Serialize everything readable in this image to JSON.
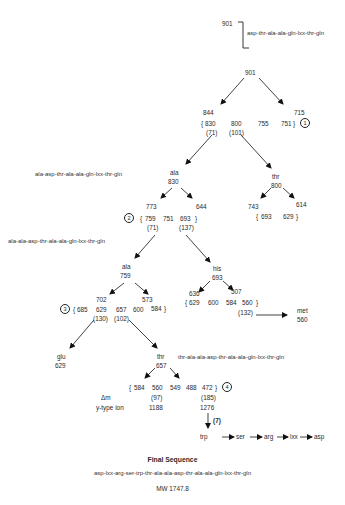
{
  "parent": {
    "mass": "901",
    "sequence": "asp-thr-ala-ala-gln-lxx-thr-gln"
  },
  "tree": {
    "root": "901",
    "level1": {
      "left": "844",
      "right": "715",
      "group": [
        "830",
        "800",
        "755",
        "751"
      ],
      "deltas": [
        "(71)",
        "(101)"
      ],
      "marker": "1"
    },
    "branch_ala830": {
      "sequence": "ala-asp-thr-ala-ala-gln-lxx-thr-gln",
      "residue": "ala",
      "mass": "830",
      "left": "773",
      "right": "644",
      "group": [
        "759",
        "751",
        "693"
      ],
      "deltas": [
        "(71)",
        "(137)"
      ],
      "marker": "2"
    },
    "branch_thr800": {
      "residue": "thr",
      "mass": "800",
      "left": "743",
      "right": "614",
      "group": [
        "693",
        "629"
      ]
    },
    "branch_ala759": {
      "sequence": "ala-ala-asp-thr-ala-ala-gln-lxx-thr-gln",
      "residue": "ala",
      "mass": "759",
      "left": "702",
      "right": "573",
      "group": [
        "685",
        "629",
        "657",
        "600",
        "584"
      ],
      "deltas": [
        "(130)",
        "(102)"
      ],
      "marker": "3"
    },
    "branch_his693": {
      "residue": "his",
      "mass": "693",
      "left": "636",
      "right": "507",
      "group": [
        "629",
        "600",
        "584",
        "560"
      ],
      "delta": "(132)",
      "met_residue": "met",
      "met_mass": "560"
    },
    "branch_glu": {
      "residue": "glu",
      "mass": "629"
    },
    "branch_thr657": {
      "sequence": "thr-ala-ala-asp-thr-ala-ala-gln-lxx-thr-gln",
      "residue": "thr",
      "mass": "657",
      "group": [
        "584",
        "560",
        "549",
        "488",
        "472"
      ],
      "marker": "4",
      "delta_label": "Δm",
      "deltas": [
        "(97)",
        "(185)"
      ],
      "ion_label": "y-type ion",
      "ions": [
        "1188",
        "1276"
      ],
      "step_label": "(7)"
    },
    "ladder": [
      "trp",
      "ser",
      "arg",
      "lxx",
      "asp"
    ]
  },
  "final": {
    "title": "Final Sequence",
    "sequence": "asp-lxx-arg-ser-trp-thr-ala-ala-asp-thr-ala-ala-gln-lxx-thr-gln",
    "mw": "MW 1747.8"
  }
}
